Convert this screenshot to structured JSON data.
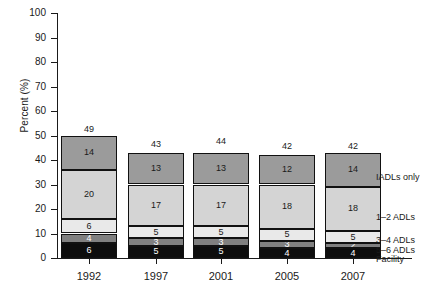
{
  "chart_data": {
    "type": "bar",
    "subtype": "stacked-bar",
    "title": "",
    "xlabel": "",
    "ylabel": "Percent (%)",
    "ylim": [
      0,
      100
    ],
    "yticks": [
      0,
      10,
      20,
      30,
      40,
      50,
      60,
      70,
      80,
      90,
      100
    ],
    "ytick_labels": [
      "0",
      "10",
      "20",
      "30",
      "40",
      "50",
      "60",
      "70",
      "80",
      "90",
      "100"
    ],
    "grid": false,
    "legend_position": "right",
    "categories": [
      "1992",
      "1997",
      "2001",
      "2005",
      "2007"
    ],
    "series": [
      {
        "name": "Facility",
        "color": "#0d0d0d",
        "text_color": "light",
        "values": [
          6,
          5,
          5,
          4,
          4
        ]
      },
      {
        "name": "5–6 ADLs",
        "color": "#808080",
        "text_color": "light",
        "values": [
          4,
          3,
          3,
          3,
          2
        ]
      },
      {
        "name": "3–4 ADLs",
        "color": "#e9e9e9",
        "text_color": "dark",
        "values": [
          6,
          5,
          5,
          5,
          5
        ]
      },
      {
        "name": "1–2 ADLs",
        "color": "#d4d4d4",
        "text_color": "dark",
        "values": [
          20,
          17,
          17,
          18,
          18
        ]
      },
      {
        "name": "IADLs only",
        "color": "#9b9b9b",
        "text_color": "dark",
        "values": [
          14,
          13,
          13,
          12,
          14
        ]
      }
    ],
    "totals": [
      49,
      43,
      44,
      42,
      42
    ],
    "total_labels": [
      "49",
      "43",
      "44",
      "42",
      "42"
    ],
    "legend_entries": [
      "IADLs only",
      "1–2 ADLs",
      "3–4 ADLs",
      "5–6 ADLs",
      "Facility"
    ],
    "segment_labels": [
      [
        "6",
        "4",
        "6",
        "20",
        "14"
      ],
      [
        "5",
        "3",
        "5",
        "17",
        "13"
      ],
      [
        "5",
        "3",
        "5",
        "17",
        "13"
      ],
      [
        "4",
        "3",
        "5",
        "18",
        "12"
      ],
      [
        "4",
        "2",
        "5",
        "18",
        "14"
      ]
    ]
  },
  "axes": {
    "y_title": "Percent (%)"
  }
}
